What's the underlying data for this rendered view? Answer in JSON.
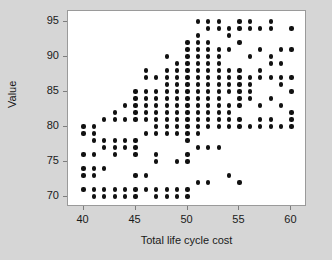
{
  "chart_data": {
    "type": "scatter",
    "title": "",
    "xlabel": "Total life cycle cost",
    "ylabel": "Value",
    "xlim": [
      38.5,
      61.5
    ],
    "ylim": [
      68.5,
      96.5
    ],
    "xticks": [
      40,
      45,
      50,
      55,
      60
    ],
    "yticks": [
      70,
      75,
      80,
      85,
      90,
      95
    ],
    "grid": false,
    "legend": null,
    "marker": "filled-circle",
    "marker_color": "#111111",
    "plot_background": "#ffffff",
    "figure_background": "#d6d6d6",
    "points": [
      [
        40,
        80
      ],
      [
        40,
        79
      ],
      [
        40,
        76
      ],
      [
        40,
        74
      ],
      [
        40,
        73
      ],
      [
        40,
        71
      ],
      [
        41,
        80
      ],
      [
        41,
        79
      ],
      [
        41,
        78
      ],
      [
        41,
        76
      ],
      [
        41,
        74
      ],
      [
        41,
        73
      ],
      [
        41,
        71
      ],
      [
        41,
        70
      ],
      [
        42,
        81
      ],
      [
        42,
        78
      ],
      [
        42,
        77
      ],
      [
        42,
        74
      ],
      [
        42,
        71
      ],
      [
        42,
        70
      ],
      [
        43,
        82
      ],
      [
        43,
        81
      ],
      [
        43,
        78
      ],
      [
        43,
        77
      ],
      [
        43,
        76
      ],
      [
        43,
        71
      ],
      [
        43,
        70
      ],
      [
        44,
        83
      ],
      [
        44,
        81
      ],
      [
        44,
        78
      ],
      [
        44,
        77
      ],
      [
        44,
        71
      ],
      [
        44,
        70
      ],
      [
        45,
        85
      ],
      [
        45,
        84
      ],
      [
        45,
        83
      ],
      [
        45,
        82
      ],
      [
        45,
        81
      ],
      [
        45,
        78
      ],
      [
        45,
        77
      ],
      [
        45,
        76
      ],
      [
        45,
        73
      ],
      [
        45,
        71
      ],
      [
        45,
        70
      ],
      [
        46,
        88
      ],
      [
        46,
        87
      ],
      [
        46,
        85
      ],
      [
        46,
        84
      ],
      [
        46,
        83
      ],
      [
        46,
        82
      ],
      [
        46,
        81
      ],
      [
        46,
        79
      ],
      [
        46,
        73
      ],
      [
        46,
        71
      ],
      [
        47,
        87
      ],
      [
        47,
        85
      ],
      [
        47,
        84
      ],
      [
        47,
        83
      ],
      [
        47,
        82
      ],
      [
        47,
        81
      ],
      [
        47,
        80
      ],
      [
        47,
        79
      ],
      [
        47,
        76
      ],
      [
        47,
        75
      ],
      [
        47,
        71
      ],
      [
        47,
        70
      ],
      [
        48,
        90
      ],
      [
        48,
        88
      ],
      [
        48,
        87
      ],
      [
        48,
        86
      ],
      [
        48,
        85
      ],
      [
        48,
        84
      ],
      [
        48,
        83
      ],
      [
        48,
        82
      ],
      [
        48,
        81
      ],
      [
        48,
        80
      ],
      [
        48,
        79
      ],
      [
        48,
        71
      ],
      [
        48,
        70
      ],
      [
        49,
        89
      ],
      [
        49,
        88
      ],
      [
        49,
        87
      ],
      [
        49,
        86
      ],
      [
        49,
        85
      ],
      [
        49,
        84
      ],
      [
        49,
        83
      ],
      [
        49,
        82
      ],
      [
        49,
        81
      ],
      [
        49,
        80
      ],
      [
        49,
        79
      ],
      [
        49,
        75
      ],
      [
        49,
        71
      ],
      [
        49,
        70
      ],
      [
        50,
        92
      ],
      [
        50,
        91
      ],
      [
        50,
        90
      ],
      [
        50,
        89
      ],
      [
        50,
        88
      ],
      [
        50,
        87
      ],
      [
        50,
        86
      ],
      [
        50,
        85
      ],
      [
        50,
        84
      ],
      [
        50,
        83
      ],
      [
        50,
        82
      ],
      [
        50,
        81
      ],
      [
        50,
        80
      ],
      [
        50,
        79
      ],
      [
        50,
        78
      ],
      [
        50,
        76
      ],
      [
        50,
        75
      ],
      [
        50,
        71
      ],
      [
        50,
        70
      ],
      [
        51,
        95
      ],
      [
        51,
        93
      ],
      [
        51,
        92
      ],
      [
        51,
        91
      ],
      [
        51,
        90
      ],
      [
        51,
        89
      ],
      [
        51,
        88
      ],
      [
        51,
        87
      ],
      [
        51,
        86
      ],
      [
        51,
        85
      ],
      [
        51,
        84
      ],
      [
        51,
        83
      ],
      [
        51,
        82
      ],
      [
        51,
        81
      ],
      [
        51,
        80
      ],
      [
        51,
        79
      ],
      [
        51,
        77
      ],
      [
        51,
        72
      ],
      [
        52,
        95
      ],
      [
        52,
        94
      ],
      [
        52,
        92
      ],
      [
        52,
        91
      ],
      [
        52,
        90
      ],
      [
        52,
        89
      ],
      [
        52,
        88
      ],
      [
        52,
        87
      ],
      [
        52,
        86
      ],
      [
        52,
        85
      ],
      [
        52,
        84
      ],
      [
        52,
        83
      ],
      [
        52,
        82
      ],
      [
        52,
        81
      ],
      [
        52,
        80
      ],
      [
        52,
        77
      ],
      [
        52,
        72
      ],
      [
        53,
        95
      ],
      [
        53,
        94
      ],
      [
        53,
        91
      ],
      [
        53,
        90
      ],
      [
        53,
        89
      ],
      [
        53,
        88
      ],
      [
        53,
        87
      ],
      [
        53,
        86
      ],
      [
        53,
        85
      ],
      [
        53,
        84
      ],
      [
        53,
        83
      ],
      [
        53,
        82
      ],
      [
        53,
        81
      ],
      [
        53,
        80
      ],
      [
        53,
        77
      ],
      [
        54,
        94
      ],
      [
        54,
        93
      ],
      [
        54,
        91
      ],
      [
        54,
        88
      ],
      [
        54,
        87
      ],
      [
        54,
        86
      ],
      [
        54,
        85
      ],
      [
        54,
        83
      ],
      [
        54,
        82
      ],
      [
        54,
        81
      ],
      [
        54,
        80
      ],
      [
        54,
        73
      ],
      [
        55,
        95
      ],
      [
        55,
        94
      ],
      [
        55,
        92
      ],
      [
        55,
        88
      ],
      [
        55,
        87
      ],
      [
        55,
        86
      ],
      [
        55,
        85
      ],
      [
        55,
        84
      ],
      [
        55,
        83
      ],
      [
        55,
        81
      ],
      [
        55,
        80
      ],
      [
        55,
        72
      ],
      [
        56,
        95
      ],
      [
        56,
        94
      ],
      [
        56,
        90
      ],
      [
        56,
        87
      ],
      [
        56,
        86
      ],
      [
        56,
        85
      ],
      [
        56,
        84
      ],
      [
        56,
        80
      ],
      [
        57,
        94
      ],
      [
        57,
        91
      ],
      [
        57,
        88
      ],
      [
        57,
        87
      ],
      [
        57,
        83
      ],
      [
        57,
        81
      ],
      [
        57,
        80
      ],
      [
        58,
        95
      ],
      [
        58,
        94
      ],
      [
        58,
        90
      ],
      [
        58,
        89
      ],
      [
        58,
        87
      ],
      [
        58,
        84
      ],
      [
        58,
        81
      ],
      [
        58,
        80
      ],
      [
        59,
        91
      ],
      [
        59,
        89
      ],
      [
        59,
        87
      ],
      [
        59,
        86
      ],
      [
        59,
        83
      ],
      [
        59,
        80
      ],
      [
        60,
        94
      ],
      [
        60,
        91
      ],
      [
        60,
        87
      ],
      [
        60,
        85
      ],
      [
        60,
        82
      ],
      [
        60,
        81
      ],
      [
        60,
        80
      ]
    ]
  }
}
